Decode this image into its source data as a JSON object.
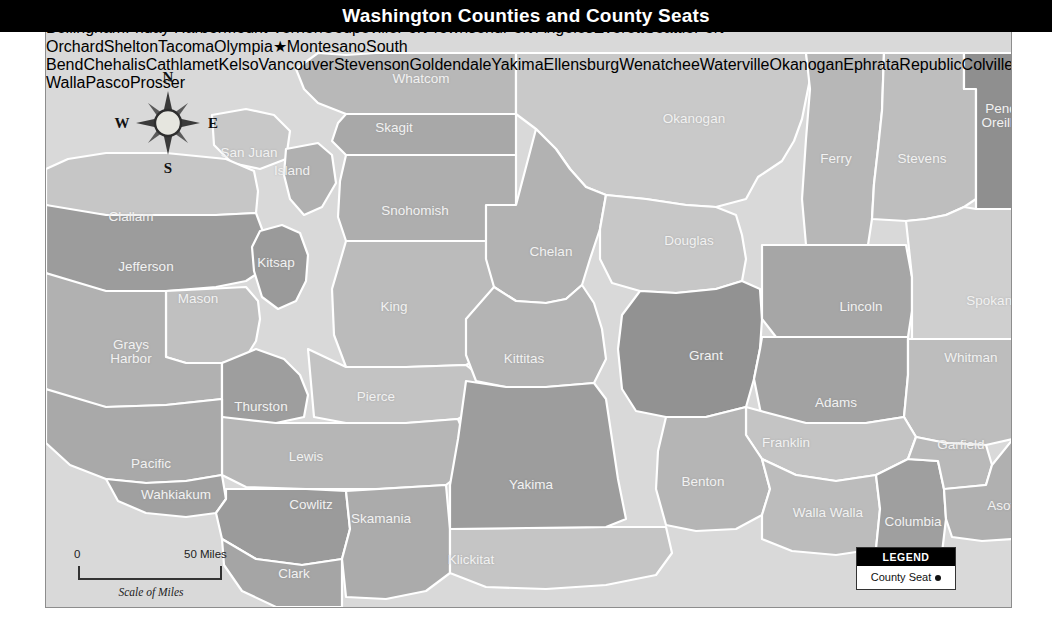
{
  "title": "Washington Counties and County Seats",
  "legend": {
    "header": "LEGEND",
    "item_label": "County Seat",
    "marker": "dot"
  },
  "scale": {
    "zero": "0",
    "max": "50 Miles",
    "caption": "Scale of Miles"
  },
  "compass": {
    "north": "N",
    "south": "S",
    "east": "E",
    "west": "W"
  },
  "colors": {
    "title_bg": "#000000",
    "title_fg": "#ffffff",
    "county_label": "#f2f2f2",
    "city_label": "#111111",
    "water": "#d9d9d9",
    "border": "#ffffff",
    "frame": "#8d8d8d",
    "shades": [
      "#d2d2d2",
      "#c2c2c2",
      "#b3b3b3",
      "#a3a3a3",
      "#949494",
      "#858585"
    ]
  },
  "counties": [
    {
      "name": "Whatcom",
      "lx": 375,
      "ly": 60,
      "shade": "#b8b8b8"
    },
    {
      "name": "Skagit",
      "lx": 348,
      "ly": 109,
      "shade": "#a8a8a8"
    },
    {
      "name": "San Juan",
      "lx": 203,
      "ly": 134,
      "shade": "#c8c8c8"
    },
    {
      "name": "Island",
      "lx": 246,
      "ly": 152,
      "shade": "#b0b0b0"
    },
    {
      "name": "Snohomish",
      "lx": 369,
      "ly": 192,
      "shade": "#aeaeae"
    },
    {
      "name": "Clallam",
      "lx": 85,
      "ly": 198,
      "shade": "#c6c6c6"
    },
    {
      "name": "Jefferson",
      "lx": 100,
      "ly": 248,
      "shade": "#9c9c9c"
    },
    {
      "name": "Kitsap",
      "lx": 230,
      "ly": 244,
      "shade": "#9a9a9a"
    },
    {
      "name": "King",
      "lx": 348,
      "ly": 288,
      "shade": "#bbbbbb"
    },
    {
      "name": "Mason",
      "lx": 152,
      "ly": 280,
      "shade": "#c0c0c0"
    },
    {
      "name": "Grays Harbor",
      "lx": 85,
      "ly": 333,
      "shade": "#b1b1b1"
    },
    {
      "name": "Thurston",
      "lx": 215,
      "ly": 388,
      "shade": "#9e9e9e"
    },
    {
      "name": "Pierce",
      "lx": 330,
      "ly": 378,
      "shade": "#c3c3c3"
    },
    {
      "name": "Lewis",
      "lx": 260,
      "ly": 438,
      "shade": "#b6b6b6"
    },
    {
      "name": "Pacific",
      "lx": 105,
      "ly": 445,
      "shade": "#a9a9a9"
    },
    {
      "name": "Wahkiakum",
      "lx": 130,
      "ly": 476,
      "shade": "#a0a0a0"
    },
    {
      "name": "Cowlitz",
      "lx": 265,
      "ly": 486,
      "shade": "#9b9b9b"
    },
    {
      "name": "Clark",
      "lx": 248,
      "ly": 555,
      "shade": "#a5a5a5"
    },
    {
      "name": "Skamania",
      "lx": 335,
      "ly": 500,
      "shade": "#ababab"
    },
    {
      "name": "Klickitat",
      "lx": 425,
      "ly": 541,
      "shade": "#c5c5c5"
    },
    {
      "name": "Yakima",
      "lx": 485,
      "ly": 466,
      "shade": "#9d9d9d"
    },
    {
      "name": "Kittitas",
      "lx": 478,
      "ly": 340,
      "shade": "#b4b4b4"
    },
    {
      "name": "Chelan",
      "lx": 505,
      "ly": 233,
      "shade": "#b2b2b2"
    },
    {
      "name": "Okanogan",
      "lx": 648,
      "ly": 100,
      "shade": "#c9c9c9"
    },
    {
      "name": "Douglas",
      "lx": 643,
      "ly": 222,
      "shade": "#c7c7c7"
    },
    {
      "name": "Grant",
      "lx": 660,
      "ly": 337,
      "shade": "#929292"
    },
    {
      "name": "Ferry",
      "lx": 790,
      "ly": 140,
      "shade": "#b7b7b7"
    },
    {
      "name": "Stevens",
      "lx": 876,
      "ly": 140,
      "shade": "#bebebe"
    },
    {
      "name": "Pend Oreille",
      "lx": 955,
      "ly": 97,
      "shade": "#8f8f8f"
    },
    {
      "name": "Lincoln",
      "lx": 815,
      "ly": 288,
      "shade": "#a6a6a6"
    },
    {
      "name": "Spokane",
      "lx": 947,
      "ly": 282,
      "shade": "#cfcfcf"
    },
    {
      "name": "Adams",
      "lx": 790,
      "ly": 384,
      "shade": "#a2a2a2"
    },
    {
      "name": "Whitman",
      "lx": 925,
      "ly": 339,
      "shade": "#bdbdbd"
    },
    {
      "name": "Franklin",
      "lx": 740,
      "ly": 424,
      "shade": "#c4c4c4"
    },
    {
      "name": "Benton",
      "lx": 657,
      "ly": 463,
      "shade": "#b5b5b5"
    },
    {
      "name": "Walla Walla",
      "lx": 782,
      "ly": 494,
      "shade": "#bcbcbc"
    },
    {
      "name": "Columbia",
      "lx": 867,
      "ly": 503,
      "shade": "#9f9f9f"
    },
    {
      "name": "Garfield",
      "lx": 915,
      "ly": 426,
      "shade": "#b9b9b9"
    },
    {
      "name": "Asotin",
      "lx": 960,
      "ly": 487,
      "shade": "#b0b0b0"
    }
  ],
  "cities": [
    {
      "name": "Bellingham",
      "nx": 299,
      "ny": 74,
      "dx": 249,
      "dy": 74,
      "marker": "dot"
    },
    {
      "name": "Friday Harbor",
      "nx": 218,
      "ny": 100,
      "dx": 208,
      "dy": 120,
      "marker": "dot"
    },
    {
      "name": "Mount Vernon",
      "nx": 323,
      "ny": 126,
      "dx": 268,
      "dy": 126,
      "marker": "dot"
    },
    {
      "name": "Coupeville",
      "nx": 259,
      "ny": 166,
      "dx": 218,
      "dy": 166,
      "marker": "dot"
    },
    {
      "name": "Port Townsend",
      "nx": 218,
      "ny": 190,
      "dx": 203,
      "dy": 175,
      "marker": "dot"
    },
    {
      "name": "Port Angeles",
      "nx": 81,
      "ny": 178,
      "dx": 132,
      "dy": 180,
      "marker": "dot"
    },
    {
      "name": "Everett",
      "nx": 310,
      "ny": 220,
      "dx": 297,
      "dy": 208,
      "marker": "dot"
    },
    {
      "name": "Seattle",
      "nx": 263,
      "ny": 250,
      "dx": 272,
      "dy": 265,
      "marker": "dot"
    },
    {
      "name": "Port Orchard",
      "nx": 218,
      "ny": 268,
      "dx": 238,
      "dy": 283,
      "marker": "dot"
    },
    {
      "name": "Shelton",
      "nx": 163,
      "ny": 318,
      "dx": 168,
      "dy": 337,
      "marker": "dot"
    },
    {
      "name": "Tacoma",
      "nx": 258,
      "ny": 338,
      "dx": 257,
      "dy": 320,
      "marker": "dot"
    },
    {
      "name": "Olympia",
      "nx": 202,
      "ny": 367,
      "dx": 198,
      "dy": 350,
      "marker": "star"
    },
    {
      "name": "Montesano",
      "nx": 73,
      "ny": 357,
      "dx": 84,
      "dy": 375,
      "marker": "dot"
    },
    {
      "name": "South Bend",
      "nx": 89,
      "ny": 411,
      "dx": 95,
      "dy": 428,
      "marker": "dot"
    },
    {
      "name": "Chehalis",
      "nx": 225,
      "ny": 415,
      "dx": 192,
      "dy": 415,
      "marker": "dot"
    },
    {
      "name": "Cathlamet",
      "nx": 145,
      "ny": 495,
      "dx": 154,
      "dy": 511,
      "marker": "dot"
    },
    {
      "name": "Kelso",
      "nx": 218,
      "ny": 504,
      "dx": 189,
      "dy": 504,
      "marker": "dot"
    },
    {
      "name": "Vancouver",
      "nx": 243,
      "ny": 580,
      "dx": 238,
      "dy": 599,
      "marker": "dot"
    },
    {
      "name": "Stevenson",
      "nx": 338,
      "ny": 568,
      "dx": 345,
      "dy": 586,
      "marker": "dot"
    },
    {
      "name": "Goldendale",
      "nx": 552,
      "ny": 553,
      "dx": 518,
      "dy": 553,
      "marker": "dot"
    },
    {
      "name": "Yakima",
      "nx": 551,
      "ny": 427,
      "dx": 516,
      "dy": 427,
      "marker": "dot"
    },
    {
      "name": "Ellensburg",
      "nx": 551,
      "ny": 367,
      "dx": 513,
      "dy": 367,
      "marker": "dot"
    },
    {
      "name": "Wenatchee",
      "nx": 537,
      "ny": 288,
      "dx": 584,
      "dy": 297,
      "marker": "dot"
    },
    {
      "name": "Waterville",
      "nx": 607,
      "ny": 257,
      "dx": 567,
      "dy": 257,
      "marker": "dot"
    },
    {
      "name": "Okanogan",
      "nx": 651,
      "ny": 140,
      "dx": 649,
      "dy": 156,
      "marker": "dot"
    },
    {
      "name": "Ephrata",
      "nx": 672,
      "ny": 310,
      "dx": 641,
      "dy": 310,
      "marker": "dot"
    },
    {
      "name": "Republic",
      "nx": 791,
      "ly": 0,
      "ny": 83,
      "dx": 753,
      "dy": 83,
      "marker": "dot"
    },
    {
      "name": "Colville",
      "nx": 877,
      "ny": 93,
      "dx": 875,
      "dy": 109,
      "marker": "dot"
    },
    {
      "name": "Newport",
      "nx": 959,
      "ny": 162,
      "dx": 1003,
      "dy": 172,
      "marker": "dot"
    },
    {
      "name": "Spokane",
      "nx": 931,
      "ny": 233,
      "dx": 930,
      "dy": 249,
      "marker": "dot"
    },
    {
      "name": "Davenport",
      "nx": 793,
      "ny": 250,
      "dx": 842,
      "dy": 254,
      "marker": "dot"
    },
    {
      "name": "Ritzville",
      "nx": 800,
      "ny": 334,
      "dx": 800,
      "dy": 352,
      "marker": "dot"
    },
    {
      "name": "Colfax",
      "nx": 907,
      "ny": 365,
      "dx": 941,
      "dy": 370,
      "marker": "dot"
    },
    {
      "name": "Pomeroy",
      "nx": 917,
      "ny": 452,
      "dx": 913,
      "dy": 434,
      "marker": "dot"
    },
    {
      "name": "Dayton",
      "nx": 882,
      "ny": 469,
      "dx": 846,
      "dy": 466,
      "marker": "dot"
    },
    {
      "name": "Asotin",
      "nx": 965,
      "ny": 466,
      "dx": 995,
      "dy": 466,
      "marker": "dot"
    },
    {
      "name": "Walla Walla",
      "nx": 784,
      "ny": 519,
      "dx": 833,
      "dy": 522,
      "marker": "dot"
    },
    {
      "name": "Pasco",
      "nx": 716,
      "ny": 462,
      "dx": 713,
      "dy": 478,
      "marker": "dot"
    },
    {
      "name": "Prosser",
      "nx": 645,
      "ny": 500,
      "dx": 613,
      "dy": 500,
      "marker": "dot"
    }
  ]
}
